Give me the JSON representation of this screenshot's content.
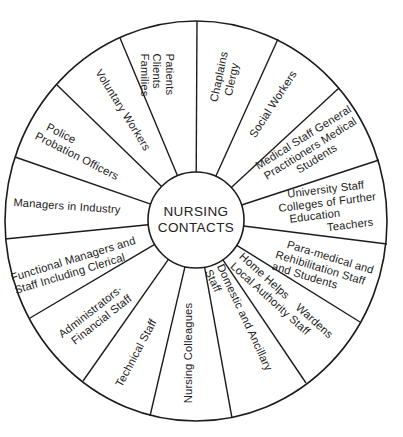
{
  "diagram": {
    "type": "wheel",
    "center": {
      "line1": "NURSING",
      "line2": "CONTACTS"
    },
    "stroke_color": "#1c1c1c",
    "segments": [
      {
        "id": "patients",
        "lines": [
          "Patients",
          "Clients",
          "Families"
        ]
      },
      {
        "id": "voluntary",
        "lines": [
          "Voluntary Workers"
        ]
      },
      {
        "id": "police",
        "lines": [
          "Police",
          "Probation Officers"
        ]
      },
      {
        "id": "managers-industry",
        "lines": [
          "Managers in Industry"
        ]
      },
      {
        "id": "functional-managers",
        "lines": [
          "Functional Managers and",
          "Staff Including Clerical"
        ]
      },
      {
        "id": "administrators",
        "lines": [
          "Administrators·",
          "Financial Staff"
        ]
      },
      {
        "id": "technical",
        "lines": [
          "Technical Staff"
        ]
      },
      {
        "id": "nursing-colleagues",
        "lines": [
          "Nursing Colleagues"
        ]
      },
      {
        "id": "domestic",
        "lines": [
          "Domestic and Ancillary",
          "Staff"
        ]
      },
      {
        "id": "home-helps",
        "lines": [
          "Home Helps    Wardens",
          "Local Authority Staff"
        ]
      },
      {
        "id": "para-medical",
        "lines": [
          "Para-medical and",
          "Rehibilitation Staff",
          "and Students"
        ]
      },
      {
        "id": "university",
        "lines": [
          "University Staff",
          "Colleges of Further",
          "Education",
          "Teachers"
        ]
      },
      {
        "id": "medical",
        "lines": [
          "Medical Staff General",
          "Practitioners Medical",
          "Students"
        ]
      },
      {
        "id": "social-workers",
        "lines": [
          "Social Workers"
        ]
      },
      {
        "id": "chaplains",
        "lines": [
          "Chaplains",
          "Clergy"
        ]
      }
    ]
  }
}
